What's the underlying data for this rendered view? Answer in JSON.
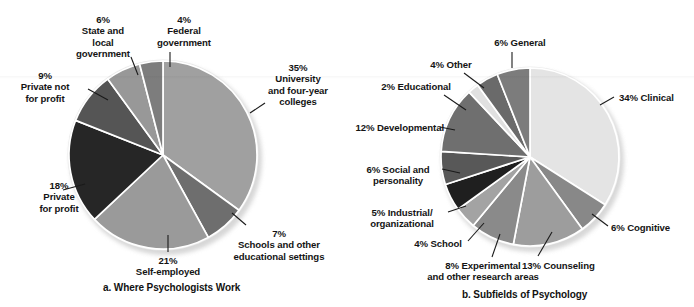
{
  "figure": {
    "background": "#ffffff",
    "leader_color": "#1a1a1a"
  },
  "charts": [
    {
      "key": "where_psychologists_work",
      "caption": "a. Where Psychologists Work",
      "caption_pos": {
        "x": 103,
        "y": 288
      },
      "center": {
        "x": 163,
        "y": 155
      },
      "radius": 94,
      "rim_color": "#e9e9e9",
      "shadow_color": "#c9c9c9"
    },
    {
      "key": "subfields_of_psychology",
      "caption": "b. Subfields of Psychology",
      "caption_pos": {
        "x": 462,
        "y": 294
      },
      "center": {
        "x": 530,
        "y": 157
      },
      "radius": 89,
      "rim_color": "#eeeeee",
      "shadow_color": "#cacaca"
    }
  ],
  "chart_data": [
    {
      "type": "pie",
      "title": "a. Where Psychologists Work",
      "start_angle": 0,
      "direction": "clockwise",
      "units": "percent",
      "categories": [
        "University and four-year colleges",
        "Schools and other educational settings",
        "Self-employed",
        "Private for profit",
        "Private not for profit",
        "State and local government",
        "Federal government"
      ],
      "values": [
        35,
        7,
        21,
        18,
        9,
        6,
        4
      ],
      "colors": [
        "#a0a0a0",
        "#6e6e6e",
        "#9a9a9a",
        "#262626",
        "#555555",
        "#989898",
        "#7d7d7d"
      ],
      "labels": [
        {
          "pct": "35%",
          "lines": [
            "35%",
            "University",
            "and four-year",
            "colleges"
          ]
        },
        {
          "pct": "7%",
          "lines": [
            "7%",
            "Schools and other",
            "educational settings"
          ]
        },
        {
          "pct": "21%",
          "lines": [
            "21%",
            "Self-employed"
          ]
        },
        {
          "pct": "18%",
          "lines": [
            "18%",
            "Private",
            "for profit"
          ]
        },
        {
          "pct": "9%",
          "lines": [
            "9%",
            "Private not",
            "for profit"
          ]
        },
        {
          "pct": "6%",
          "lines": [
            "6%",
            "State and",
            "local",
            "government"
          ]
        },
        {
          "pct": "4%",
          "lines": [
            "4%",
            "Federal",
            "government"
          ]
        }
      ]
    },
    {
      "type": "pie",
      "title": "b. Subfields of Psychology",
      "start_angle": 0,
      "direction": "clockwise",
      "units": "percent",
      "categories": [
        "Clinical",
        "Cognitive",
        "Counseling",
        "Experimental and other research areas",
        "School",
        "Industrial/organizational",
        "Social and personality",
        "Developmental",
        "Educational",
        "Other",
        "General"
      ],
      "values": [
        34,
        6,
        13,
        8,
        4,
        5,
        6,
        12,
        2,
        4,
        6
      ],
      "colors": [
        "#e4e4e4",
        "#888888",
        "#9d9d9d",
        "#8a8a8a",
        "#a3a3a3",
        "#1f1f1f",
        "#585858",
        "#6f6f6f",
        "#e0e0e0",
        "#6a6a6a",
        "#7c7c7c"
      ],
      "labels": [
        {
          "pct": "34%",
          "lines": [
            "34% Clinical"
          ]
        },
        {
          "pct": "6%",
          "lines": [
            "6% Cognitive"
          ]
        },
        {
          "pct": "13%",
          "lines": [
            "13% Counseling"
          ]
        },
        {
          "pct": "8%",
          "lines": [
            "8% Experimental",
            "and other research areas"
          ]
        },
        {
          "pct": "4%",
          "lines": [
            "4% School"
          ]
        },
        {
          "pct": "5%",
          "lines": [
            "5% Industrial/",
            "organizational"
          ]
        },
        {
          "pct": "6%",
          "lines": [
            "6% Social and",
            "personality"
          ]
        },
        {
          "pct": "12%",
          "lines": [
            "12% Developmental"
          ]
        },
        {
          "pct": "2%",
          "lines": [
            "2% Educational"
          ]
        },
        {
          "pct": "4%",
          "lines": [
            "4% Other"
          ]
        },
        {
          "pct": "6%",
          "lines": [
            "6% General"
          ]
        }
      ]
    }
  ],
  "labels_a": {
    "university": "35%\nUniversity\nand four-year\ncolleges",
    "schools": "7%\nSchools and other\neducational settings",
    "self_employed": "21%\nSelf-employed",
    "private_for_profit": "18%\nPrivate\nfor profit",
    "private_not_for_profit": "9%\nPrivate not\nfor profit",
    "state_local": "6%\nState and\nlocal\ngovernment",
    "federal": "4%\nFederal\ngovernment"
  },
  "labels_b": {
    "clinical": "34% Clinical",
    "cognitive": "6% Cognitive",
    "counseling": "13% Counseling",
    "experimental": "8% Experimental\nand other research areas",
    "school": "4% School",
    "industrial": "5% Industrial/\norganizational",
    "social": "6% Social and\npersonality",
    "developmental": "12% Developmental",
    "educational": "2% Educational",
    "other": "4% Other",
    "general": "6% General"
  },
  "captions": {
    "a": "a. Where Psychologists Work",
    "b": "b. Subfields of Psychology"
  }
}
